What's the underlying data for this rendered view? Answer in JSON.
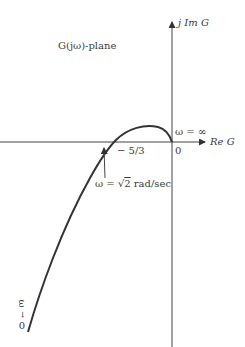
{
  "diagram": {
    "plane_label": "G(jω)-plane",
    "imag_axis_label": "j Im G",
    "real_axis_label": "Re G",
    "origin_label": "0",
    "crossing_label": "− 5/3",
    "crossing_value": -1.6667,
    "omega_infinity_label": "ω = ∞",
    "crossing_freq_label_prefix": "ω = ",
    "crossing_freq_sqrt": "2",
    "crossing_freq_unit": " rad/sec",
    "omega_zero_label": "ω",
    "omega_zero_arrow": "→",
    "omega_zero_value": "0",
    "curve_description": "Polar (Nyquist) plot: starts at ω→0 far in lower-left, rises, crosses negative real axis at -5/3 at ω=√2 rad/sec, peaks in upper half-plane, ends at origin as ω=∞"
  }
}
